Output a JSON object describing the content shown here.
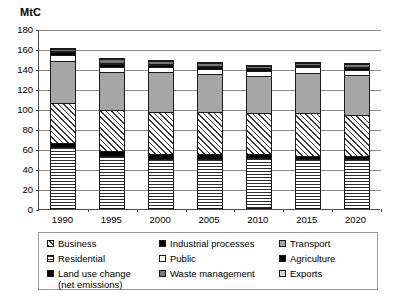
{
  "chart_data": {
    "type": "bar",
    "title": "",
    "subtitle": "",
    "xlabel": "",
    "ylabel": "MtC",
    "ylim": [
      0,
      180
    ],
    "ytick_step": 20,
    "yticks": [
      180,
      160,
      140,
      120,
      100,
      80,
      60,
      40,
      20,
      0
    ],
    "grid": true,
    "stacked": true,
    "legend_position": "bottom",
    "categories": [
      "1990",
      "1995",
      "2000",
      "2005",
      "2010",
      "2015",
      "2020"
    ],
    "series": [
      {
        "name": "Residential",
        "pattern": "horizontal-lines",
        "values": [
          62,
          53,
          50,
          50,
          51,
          50,
          50
        ]
      },
      {
        "name": "Land use change",
        "pattern": "solid-black",
        "values": [
          4,
          5,
          5,
          5,
          4,
          3,
          3
        ]
      },
      {
        "name": "Business",
        "pattern": "diagonal-hatch",
        "values": [
          40,
          41,
          42,
          42,
          41,
          43,
          41
        ]
      },
      {
        "name": "Transport",
        "pattern": "solid-gray",
        "values": [
          42,
          38,
          40,
          38,
          37,
          40,
          40
        ]
      },
      {
        "name": "Public",
        "pattern": "white",
        "values": [
          6,
          5,
          5,
          5,
          5,
          6,
          5
        ]
      },
      {
        "name": "Industrial processes",
        "pattern": "solid-black",
        "values": [
          3,
          3,
          2,
          2,
          2,
          1,
          2
        ]
      },
      {
        "name": "Agriculture",
        "pattern": "solid-black",
        "values": [
          1,
          1,
          1,
          1,
          1,
          1,
          1
        ]
      },
      {
        "name": "Waste management",
        "pattern": "dark-gray",
        "values": [
          2,
          4,
          3,
          3,
          2,
          2,
          3
        ]
      },
      {
        "name": "Exports",
        "pattern": "light-gray",
        "values": [
          1,
          1,
          1,
          1,
          1,
          1,
          1
        ]
      }
    ],
    "totals": [
      161,
      151,
      149,
      147,
      144,
      147,
      146
    ]
  },
  "legend": {
    "items": [
      {
        "label": "Business",
        "pattern": "diagonal-hatch"
      },
      {
        "label": "Industrial processes",
        "pattern": "solid-black"
      },
      {
        "label": "Transport",
        "pattern": "solid-gray"
      },
      {
        "label": "Residential",
        "pattern": "horizontal-lines"
      },
      {
        "label": "Public",
        "pattern": "white"
      },
      {
        "label": "Agriculture",
        "pattern": "solid-black"
      },
      {
        "label": "Land use change\n(net emissions)",
        "pattern": "solid-black"
      },
      {
        "label": "Waste management",
        "pattern": "dark-gray"
      },
      {
        "label": "Exports",
        "pattern": "light-gray"
      }
    ]
  },
  "colors": {
    "axis": "#4d4d4d",
    "grid": "#8c8c8c",
    "gray_fill": "#a6a6a6",
    "dark_gray_fill": "#777777",
    "light_gray_fill": "#d4d4d4",
    "black_fill": "#000000",
    "background": "#ffffff"
  }
}
